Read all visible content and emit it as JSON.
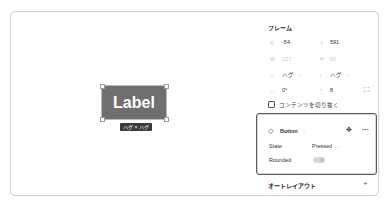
{
  "canvas": {
    "button_label": "Label",
    "size_tag": "ハグ × ハグ",
    "button_fill": "#6f6f6f"
  },
  "frame_section": {
    "title": "フレーム",
    "x_label": "X",
    "x_value": "-54",
    "y_label": "Y",
    "y_value": "591",
    "w_label": "W",
    "w_value": "127",
    "h_label": "H",
    "h_value": "60",
    "hug_w": "ハグ",
    "hug_h": "ハグ",
    "rotation": "0°",
    "radius": "8",
    "clip_content": "コンテンツを切り抜く"
  },
  "component": {
    "name": "Button",
    "props": [
      {
        "label": "State",
        "value": "Pressed"
      },
      {
        "label": "Rounded",
        "value": "off"
      }
    ]
  },
  "autolayout": {
    "title": "オートレイアウト",
    "add": "+"
  },
  "icons": {
    "component": "◇",
    "chevron": "⌄",
    "move": "✥",
    "more": "···",
    "expand": "⛶"
  }
}
